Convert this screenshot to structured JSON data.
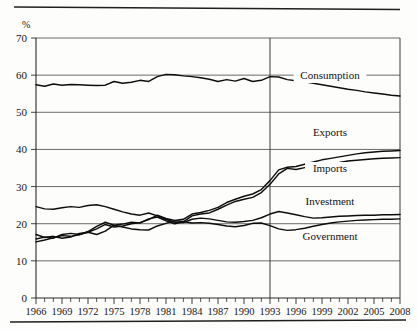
{
  "chart_data": {
    "type": "line",
    "title": "",
    "xlabel": "",
    "ylabel": "%",
    "ylim": [
      0,
      70
    ],
    "ytick_step": 10,
    "yticks": [
      0,
      10,
      20,
      30,
      40,
      50,
      60,
      70
    ],
    "xlim": [
      1966,
      2008
    ],
    "xticks": [
      1966,
      1969,
      1972,
      1975,
      1978,
      1981,
      1984,
      1987,
      1990,
      1993,
      1996,
      1999,
      2002,
      2005,
      2008
    ],
    "xtick_labels": [
      "1966",
      "1969",
      "1972",
      "1975",
      "1978",
      "1981",
      "1984",
      "1987",
      "1990",
      "1993",
      "1996",
      "1999",
      "2002",
      "2005",
      "2008"
    ],
    "minor_xticks_every": 1,
    "grid": "horizontal",
    "legend_position": "inline-right",
    "annotations": [
      {
        "name": "reference-line-1993",
        "type": "vline",
        "x": 1993
      }
    ],
    "x": [
      1966,
      1967,
      1968,
      1969,
      1970,
      1971,
      1972,
      1973,
      1974,
      1975,
      1976,
      1977,
      1978,
      1979,
      1980,
      1981,
      1982,
      1983,
      1984,
      1985,
      1986,
      1987,
      1988,
      1989,
      1990,
      1991,
      1992,
      1993,
      1994,
      1995,
      1996,
      1997,
      1998,
      1999,
      2000,
      2001,
      2002,
      2003,
      2004,
      2005,
      2006,
      2007,
      2008
    ],
    "series": [
      {
        "name": "Consumption",
        "label": "Consumption",
        "color": "#0d0d0d",
        "values": [
          57.4,
          57.0,
          57.6,
          57.3,
          57.5,
          57.4,
          57.3,
          57.2,
          57.3,
          58.3,
          57.8,
          58.1,
          58.6,
          58.3,
          59.6,
          60.2,
          60.1,
          59.8,
          59.6,
          59.3,
          58.9,
          58.3,
          58.8,
          58.4,
          59.1,
          58.3,
          58.6,
          59.6,
          59.5,
          58.8,
          58.5,
          58.2,
          57.8,
          57.4,
          57.0,
          56.6,
          56.2,
          55.9,
          55.5,
          55.2,
          54.9,
          54.6,
          54.4
        ]
      },
      {
        "name": "Exports",
        "label": "Exports",
        "color": "#0d0d0d",
        "values": [
          15.9,
          16.4,
          16.1,
          17.1,
          17.4,
          17.1,
          17.7,
          18.6,
          19.8,
          19.1,
          19.4,
          20.0,
          20.3,
          21.1,
          22.3,
          21.4,
          20.9,
          21.2,
          22.6,
          23.0,
          23.6,
          24.4,
          25.7,
          26.6,
          27.4,
          28.0,
          29.2,
          31.6,
          34.5,
          35.2,
          35.4,
          36.0,
          36.6,
          37.2,
          37.6,
          38.0,
          38.4,
          38.8,
          39.1,
          39.3,
          39.5,
          39.6,
          39.7
        ]
      },
      {
        "name": "Imports",
        "label": "Imports",
        "color": "#0d0d0d",
        "values": [
          15.1,
          15.6,
          16.2,
          16.8,
          16.6,
          17.0,
          17.9,
          19.3,
          20.4,
          19.6,
          19.9,
          20.4,
          20.2,
          21.3,
          21.8,
          20.8,
          20.0,
          20.5,
          22.1,
          22.6,
          22.9,
          23.9,
          25.0,
          26.0,
          26.6,
          27.1,
          28.4,
          30.6,
          33.4,
          34.9,
          34.6,
          35.1,
          35.4,
          35.8,
          36.2,
          36.5,
          36.9,
          37.1,
          37.3,
          37.5,
          37.6,
          37.7,
          37.8
        ]
      },
      {
        "name": "Investment",
        "label": "Investment",
        "color": "#0d0d0d",
        "values": [
          24.6,
          24.0,
          23.9,
          24.3,
          24.6,
          24.4,
          24.9,
          25.1,
          24.6,
          23.9,
          23.2,
          22.6,
          22.3,
          22.9,
          22.1,
          21.2,
          20.4,
          20.3,
          21.2,
          21.5,
          21.3,
          20.9,
          20.5,
          20.4,
          20.6,
          20.9,
          21.6,
          22.6,
          23.3,
          22.9,
          22.4,
          21.9,
          21.5,
          21.6,
          21.8,
          22.0,
          22.1,
          22.2,
          22.3,
          22.3,
          22.4,
          22.4,
          22.5
        ]
      },
      {
        "name": "Government",
        "label": "Government",
        "color": "#0d0d0d",
        "values": [
          17.1,
          16.3,
          16.6,
          16.1,
          16.4,
          17.4,
          17.7,
          17.1,
          18.0,
          19.6,
          19.1,
          18.6,
          18.4,
          18.3,
          19.4,
          20.1,
          20.8,
          20.6,
          20.2,
          20.3,
          20.1,
          19.8,
          19.4,
          19.2,
          19.5,
          20.1,
          20.2,
          19.5,
          18.6,
          18.2,
          18.4,
          18.8,
          19.3,
          19.8,
          20.2,
          20.5,
          20.7,
          20.9,
          21.0,
          21.1,
          21.2,
          21.2,
          21.3
        ]
      }
    ],
    "series_labels_inline": [
      {
        "name": "Consumption",
        "label": "Consumption",
        "x_px": 330,
        "y_px": 79
      },
      {
        "name": "Exports",
        "label": "Exports",
        "x_px": 330,
        "y_px": 136
      },
      {
        "name": "Imports",
        "label": "Imports",
        "x_px": 330,
        "y_px": 172
      },
      {
        "name": "Investment",
        "label": "Investment",
        "x_px": 330,
        "y_px": 205
      },
      {
        "name": "Government",
        "label": "Government",
        "x_px": 330,
        "y_px": 240
      }
    ]
  },
  "figure": {
    "y_axis_unit": "%"
  }
}
